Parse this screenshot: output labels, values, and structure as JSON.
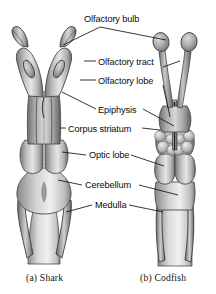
{
  "figure": {
    "background_color": "#ffffff",
    "line_color": "#141414",
    "text_color": "#0b0b0b"
  },
  "labels": [
    {
      "id": "olfactory-bulb",
      "text": "Olfactory bulb"
    },
    {
      "id": "olfactory-tract",
      "text": "Olfactory tract"
    },
    {
      "id": "olfactory-lobe",
      "text": "Olfactory lobe"
    },
    {
      "id": "epiphysis",
      "text": "Epiphysis"
    },
    {
      "id": "corpus-striatum",
      "text": "Corpus striatum"
    },
    {
      "id": "optic-lobe",
      "text": "Optic lobe"
    },
    {
      "id": "cerebellum",
      "text": "Cerebellum"
    },
    {
      "id": "medulla",
      "text": "Medulla"
    }
  ],
  "captions": {
    "left": "(a)  Shark",
    "right": "(b)  Codfish"
  },
  "specimens": {
    "left": {
      "name": "shark-brain"
    },
    "right": {
      "name": "codfish-brain"
    }
  }
}
